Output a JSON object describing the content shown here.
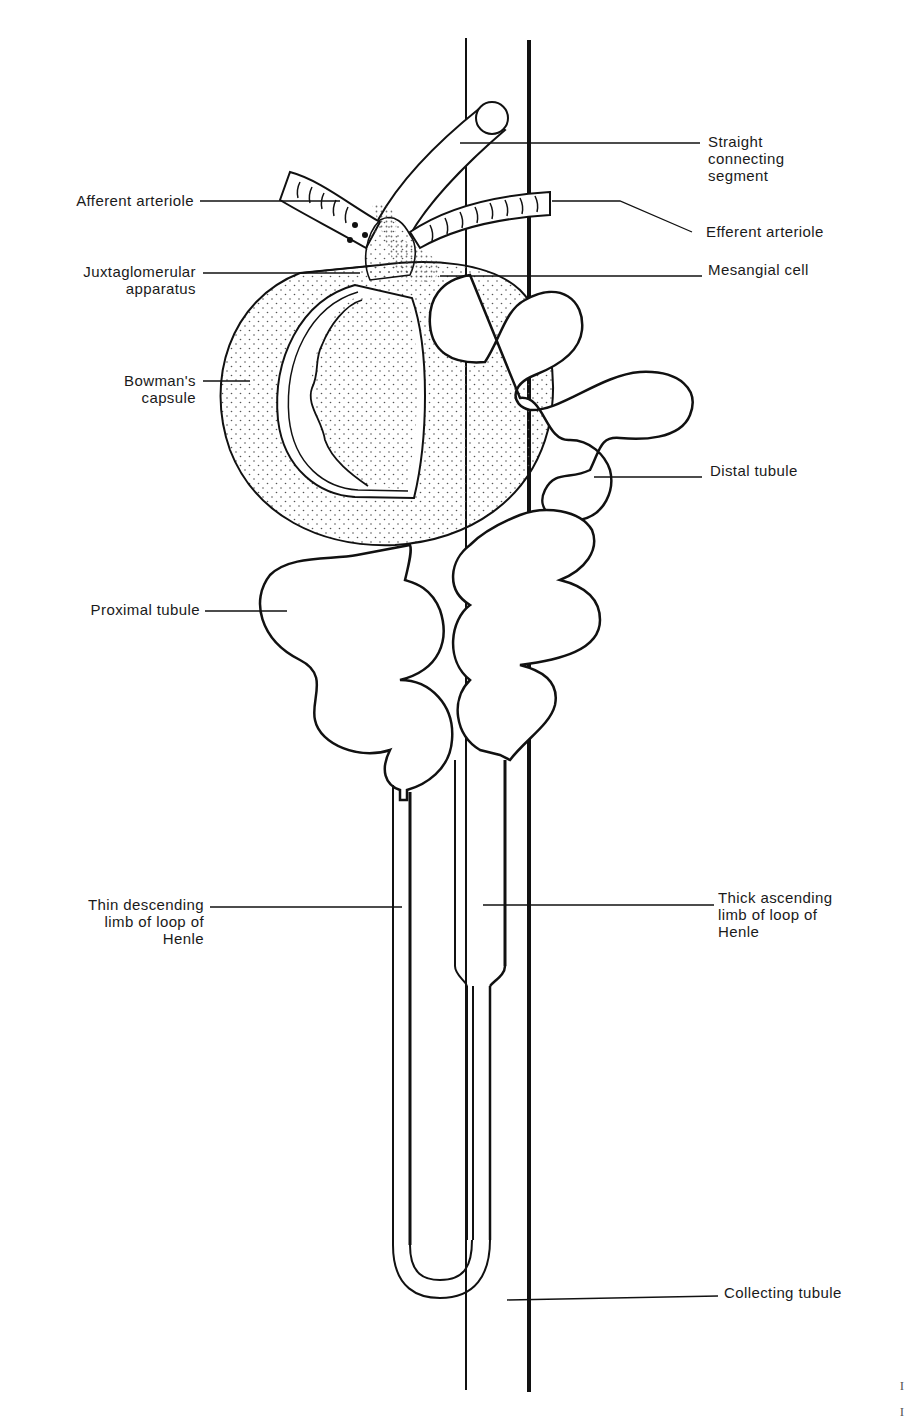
{
  "diagram": {
    "type": "anatomical-line-drawing",
    "colors": {
      "ink": "#111111",
      "stipple": "#555555",
      "background": "#ffffff"
    }
  },
  "labels": {
    "straight_connecting_segment": "Straight\nconnecting\nsegment",
    "afferent_arteriole": "Afferent arteriole",
    "efferent_arteriole": "Efferent arteriole",
    "juxtaglomerular_apparatus": "Juxtaglomerular\napparatus",
    "mesangial_cell": "Mesangial cell",
    "bowmans_capsule": "Bowman's\ncapsule",
    "distal_tubule": "Distal tubule",
    "proximal_tubule": "Proximal tubule",
    "thin_descending_limb": "Thin descending\nlimb of loop of\nHenle",
    "thick_ascending_limb": "Thick ascending\nlimb of loop of\nHenle",
    "collecting_tubule": "Collecting tubule"
  },
  "edge_marks": [
    "I",
    "I"
  ]
}
